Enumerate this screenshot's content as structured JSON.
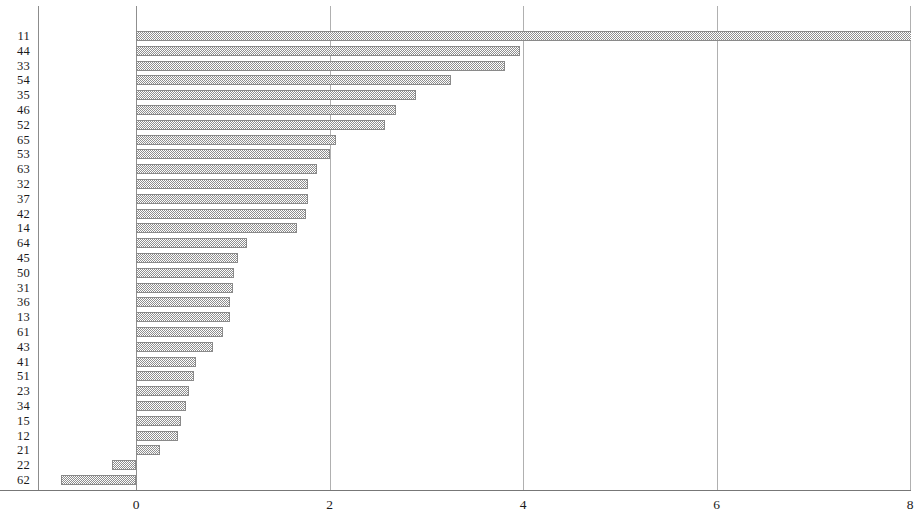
{
  "chart_data": {
    "type": "bar",
    "orientation": "horizontal",
    "title": "",
    "subtitle": "",
    "xlabel": "",
    "ylabel": "",
    "xlim": [
      -1.0,
      8.02
    ],
    "ylim": [
      0,
      31
    ],
    "grid": true,
    "legend": null,
    "xticks": [
      "0",
      "2",
      "4",
      "6",
      "8"
    ],
    "xtick_values": [
      0,
      2,
      4,
      6,
      8
    ],
    "categories": [
      "11",
      "44",
      "33",
      "54",
      "35",
      "46",
      "52",
      "65",
      "53",
      "63",
      "32",
      "37",
      "42",
      "14",
      "64",
      "45",
      "50",
      "31",
      "36",
      "13",
      "61",
      "43",
      "41",
      "51",
      "23",
      "34",
      "15",
      "12",
      "21",
      "22",
      "62"
    ],
    "values": [
      8.02,
      3.97,
      3.81,
      3.26,
      2.89,
      2.69,
      2.57,
      2.07,
      2.0,
      1.87,
      1.78,
      1.78,
      1.76,
      1.66,
      1.15,
      1.05,
      1.01,
      1.0,
      0.97,
      0.97,
      0.9,
      0.8,
      0.62,
      0.6,
      0.55,
      0.52,
      0.47,
      0.43,
      0.25,
      -0.25,
      -0.78
    ],
    "bar_color": "#8e8e8e",
    "bar_fill": "checkerboard-dither"
  },
  "axis": {
    "zero_line_label": "0",
    "tick_2": "2",
    "tick_4": "4",
    "tick_6": "6",
    "tick_8": "8"
  }
}
